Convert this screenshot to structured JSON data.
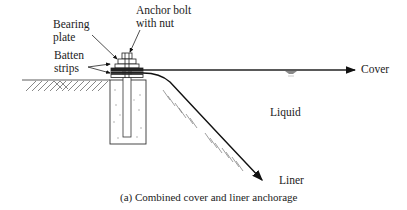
{
  "diagram": {
    "labels": {
      "bearing_plate_line1": "Bearing",
      "bearing_plate_line2": "plate",
      "anchor_bolt_line1": "Anchor bolt",
      "anchor_bolt_line2": "with nut",
      "batten_line1": "Batten",
      "batten_line2": "strips",
      "cover": "Cover",
      "liquid": "Liquid",
      "liner": "Liner"
    },
    "caption": "(a) Combined cover and liner anchorage"
  }
}
